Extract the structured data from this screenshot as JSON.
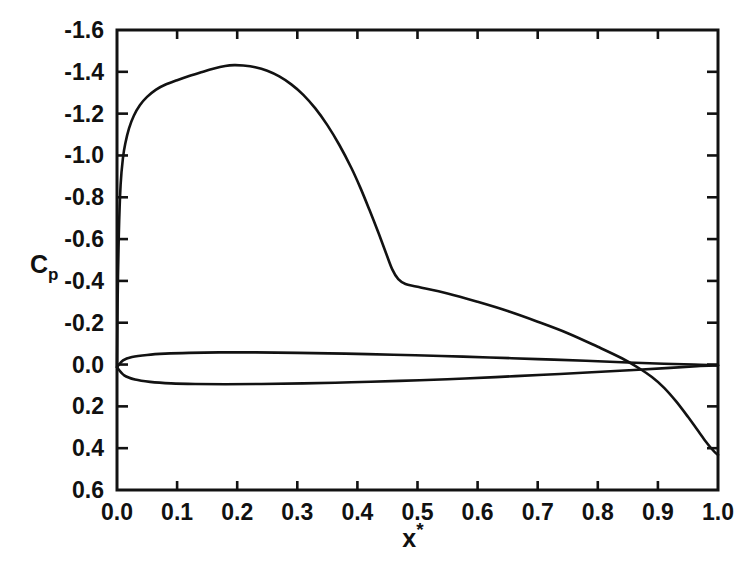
{
  "figure": {
    "name": "pressure-coefficient-distribution",
    "background_color": "#ffffff",
    "ink_color": "#121212"
  },
  "axes": {
    "x": {
      "title_base": "x",
      "title_sup": "*",
      "label": "x*",
      "min": 0.0,
      "max": 1.0,
      "tick_step": 0.1,
      "tick_labels": [
        "0.0",
        "0.1",
        "0.2",
        "0.3",
        "0.4",
        "0.5",
        "0.6",
        "0.7",
        "0.8",
        "0.9",
        "1.0"
      ],
      "tick_values": [
        0.0,
        0.1,
        0.2,
        0.3,
        0.4,
        0.5,
        0.6,
        0.7,
        0.8,
        0.9,
        1.0
      ],
      "direction": "increasing-right",
      "ticks_inward": true
    },
    "y": {
      "title_base": "C",
      "title_sub": "p",
      "label": "Cp",
      "min": -1.6,
      "max": 0.6,
      "tick_step": 0.2,
      "tick_labels": [
        "-1.6",
        "-1.4",
        "-1.2",
        "-1.0",
        "-0.8",
        "-0.6",
        "-0.4",
        "-0.2",
        "0.0",
        "0.2",
        "0.4",
        "0.6"
      ],
      "tick_values": [
        -1.6,
        -1.4,
        -1.2,
        -1.0,
        -0.8,
        -0.6,
        -0.4,
        -0.2,
        0.0,
        0.2,
        0.4,
        0.6
      ],
      "direction": "inverted-negative-up",
      "ticks_inward": true
    },
    "grid": false,
    "legend": "none"
  },
  "chart_data": {
    "type": "line",
    "title": "",
    "subtitle": "",
    "xlabel": "x*",
    "ylabel": "Cp",
    "xlim": [
      0.0,
      1.0
    ],
    "ylim": [
      -1.6,
      0.6
    ],
    "y_axis_inverted": true,
    "grid": false,
    "legend_position": "none",
    "series": [
      {
        "name": "upper-surface-suction-peak",
        "color": "#121212",
        "points": [
          [
            0.0,
            0.01
          ],
          [
            0.001,
            -0.3
          ],
          [
            0.003,
            -0.62
          ],
          [
            0.006,
            -0.86
          ],
          [
            0.01,
            -0.99
          ],
          [
            0.014,
            -1.06
          ],
          [
            0.02,
            -1.13
          ],
          [
            0.028,
            -1.19
          ],
          [
            0.038,
            -1.24
          ],
          [
            0.05,
            -1.28
          ],
          [
            0.065,
            -1.315
          ],
          [
            0.08,
            -1.338
          ],
          [
            0.1,
            -1.36
          ],
          [
            0.12,
            -1.38
          ],
          [
            0.14,
            -1.398
          ],
          [
            0.16,
            -1.415
          ],
          [
            0.18,
            -1.428
          ],
          [
            0.195,
            -1.432
          ],
          [
            0.21,
            -1.43
          ],
          [
            0.23,
            -1.422
          ],
          [
            0.25,
            -1.405
          ],
          [
            0.27,
            -1.378
          ],
          [
            0.29,
            -1.34
          ],
          [
            0.31,
            -1.29
          ],
          [
            0.33,
            -1.225
          ],
          [
            0.35,
            -1.145
          ],
          [
            0.37,
            -1.05
          ],
          [
            0.39,
            -0.94
          ],
          [
            0.405,
            -0.845
          ],
          [
            0.42,
            -0.74
          ],
          [
            0.435,
            -0.63
          ],
          [
            0.448,
            -0.53
          ],
          [
            0.458,
            -0.455
          ],
          [
            0.468,
            -0.408
          ],
          [
            0.48,
            -0.385
          ],
          [
            0.5,
            -0.372
          ],
          [
            0.55,
            -0.34
          ],
          [
            0.6,
            -0.3
          ],
          [
            0.65,
            -0.256
          ],
          [
            0.7,
            -0.205
          ],
          [
            0.75,
            -0.15
          ],
          [
            0.8,
            -0.085
          ],
          [
            0.84,
            -0.03
          ],
          [
            0.87,
            0.02
          ],
          [
            0.89,
            0.06
          ],
          [
            0.91,
            0.11
          ],
          [
            0.93,
            0.175
          ],
          [
            0.95,
            0.25
          ],
          [
            0.965,
            0.31
          ],
          [
            0.978,
            0.362
          ],
          [
            0.988,
            0.398
          ],
          [
            0.995,
            0.42
          ],
          [
            1.0,
            0.432
          ]
        ]
      },
      {
        "name": "lens-upper-branch",
        "color": "#121212",
        "points": [
          [
            0.0,
            0.012
          ],
          [
            0.01,
            -0.02
          ],
          [
            0.025,
            -0.036
          ],
          [
            0.05,
            -0.046
          ],
          [
            0.08,
            -0.052
          ],
          [
            0.12,
            -0.056
          ],
          [
            0.17,
            -0.058
          ],
          [
            0.23,
            -0.058
          ],
          [
            0.3,
            -0.056
          ],
          [
            0.38,
            -0.052
          ],
          [
            0.46,
            -0.047
          ],
          [
            0.54,
            -0.041
          ],
          [
            0.62,
            -0.034
          ],
          [
            0.7,
            -0.026
          ],
          [
            0.78,
            -0.018
          ],
          [
            0.85,
            -0.01
          ],
          [
            0.91,
            -0.004
          ],
          [
            0.96,
            0.0
          ],
          [
            1.0,
            0.004
          ]
        ]
      },
      {
        "name": "lens-lower-branch",
        "color": "#121212",
        "points": [
          [
            0.0,
            0.014
          ],
          [
            0.012,
            0.052
          ],
          [
            0.03,
            0.072
          ],
          [
            0.055,
            0.083
          ],
          [
            0.09,
            0.09
          ],
          [
            0.13,
            0.093
          ],
          [
            0.18,
            0.094
          ],
          [
            0.24,
            0.093
          ],
          [
            0.31,
            0.09
          ],
          [
            0.39,
            0.085
          ],
          [
            0.47,
            0.078
          ],
          [
            0.55,
            0.07
          ],
          [
            0.63,
            0.06
          ],
          [
            0.71,
            0.049
          ],
          [
            0.79,
            0.037
          ],
          [
            0.86,
            0.026
          ],
          [
            0.92,
            0.016
          ],
          [
            0.965,
            0.008
          ],
          [
            1.0,
            0.004
          ]
        ]
      }
    ],
    "annotations": [
      {
        "name": "suction-peak",
        "x": 0.195,
        "y": -1.432,
        "text": ""
      },
      {
        "name": "pressure-recovery-knee",
        "x": 0.468,
        "y": -0.408,
        "text": ""
      },
      {
        "name": "curve-crossing",
        "x": 0.878,
        "y": 0.026,
        "text": ""
      },
      {
        "name": "trailing-edge",
        "x": 1.0,
        "y": 0.432,
        "text": ""
      }
    ]
  }
}
